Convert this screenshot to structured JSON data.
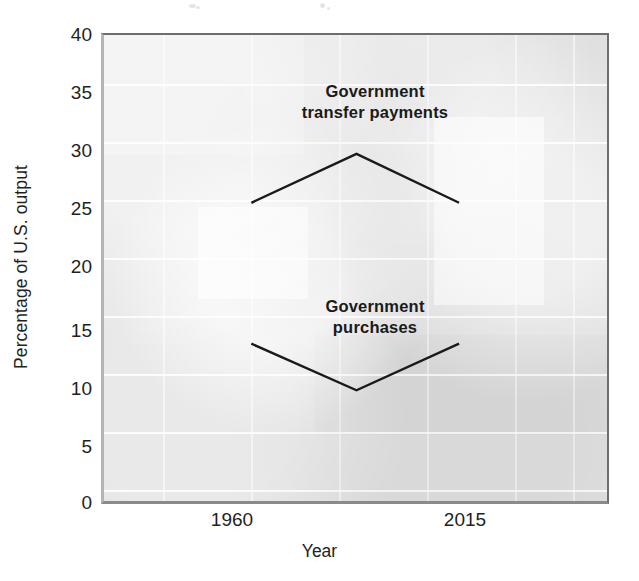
{
  "chart_data": {
    "type": "line",
    "title": "",
    "subtitle": "",
    "xlabel": "Year",
    "ylabel": "Percentage of U.S. output",
    "x": [
      "1960",
      "1990",
      "2015"
    ],
    "xtick_labels": [
      "1960",
      "2015"
    ],
    "ytick_labels": [
      "0",
      "5",
      "10",
      "15",
      "20",
      "25",
      "30",
      "35",
      "40"
    ],
    "ytick_values": [
      0,
      5,
      10,
      15,
      20,
      25,
      30,
      35,
      40
    ],
    "ylim": [
      0,
      40
    ],
    "grid": true,
    "legend": "in-plot annotations",
    "series": [
      {
        "name": "Government transfer payments",
        "values": [
          25.6,
          29.8,
          25.6
        ],
        "label_text": "Government\ntransfer payments",
        "color": "#1a1a1a"
      },
      {
        "name": "Government purchases",
        "values": [
          13.5,
          9.5,
          13.5
        ],
        "label_text": "Government\npurchases",
        "color": "#1a1a1a"
      }
    ],
    "colors": {
      "plot_background": "#e0e0e0",
      "gridline": "#ffffff",
      "line": "#1a1a1a",
      "text": "#231f20",
      "axis_border": "#6d6d6d"
    }
  }
}
